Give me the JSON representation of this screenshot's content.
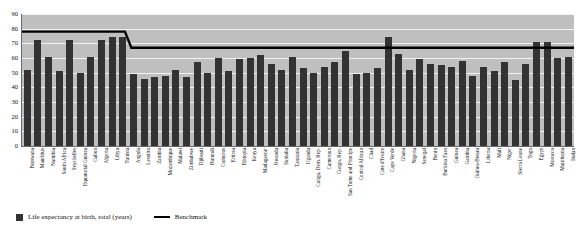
{
  "chart_data": {
    "type": "bar",
    "title": "",
    "xlabel": "",
    "ylabel": "",
    "ylim": [
      0,
      90
    ],
    "yticks": [
      0,
      10,
      20,
      30,
      40,
      50,
      60,
      70,
      80,
      90
    ],
    "grid": true,
    "legend_position": "bottom-left",
    "categories": [
      "Botswana",
      "Mauritius",
      "Namibia",
      "South Africa",
      "Seychelles",
      "Equatorial Guinea",
      "Gabon",
      "Algeria",
      "Libya",
      "Tunisia",
      "Angola",
      "Lesotho",
      "Zambia",
      "Mozambique",
      "Malawi",
      "Zimbabwe",
      "Djibouti",
      "Burundi",
      "Comoros",
      "Eritrea",
      "Ethiopia",
      "Kenya",
      "Madagascar",
      "Rwanda",
      "Somalia",
      "Tanzania",
      "Uganda",
      "Congo, Dem. Rep.",
      "Cameroon",
      "Congo, Rep.",
      "Sao Tome and Principe",
      "Central African",
      "Chad",
      "Cote d'Ivoire",
      "Cape Verde",
      "Ghana",
      "Nigeria",
      "Senegal",
      "Benin",
      "Burkina Faso",
      "Guinea",
      "Gambia",
      "Guinea-Bissau",
      "Liberia",
      "Mali",
      "Niger",
      "Sierra Leone",
      "Togo",
      "Egypt",
      "Morocco",
      "Mauritania",
      "Sudan"
    ],
    "series": [
      {
        "name": "Life expectancy at birth, total (years)",
        "color": "#333333",
        "values": [
          52,
          72,
          61,
          51,
          72,
          50,
          61,
          72,
          74,
          74,
          49,
          46,
          47,
          48,
          52,
          47,
          57,
          50,
          60,
          51,
          59,
          60,
          62,
          56,
          52,
          61,
          53,
          50,
          54,
          57,
          65,
          49,
          50,
          53,
          74,
          63,
          52,
          59,
          56,
          55,
          54,
          58,
          48,
          54,
          51,
          57,
          45,
          56,
          71,
          71,
          60,
          61
        ]
      }
    ],
    "benchmark": {
      "name": "Benchmark",
      "color": "#000000",
      "type": "step",
      "high_value": 78,
      "low_value": 67,
      "step_after_category": "Tunisia"
    }
  },
  "legend": {
    "series_label": "Life expectancy at birth, total (years)",
    "benchmark_label": "Benchmark"
  }
}
